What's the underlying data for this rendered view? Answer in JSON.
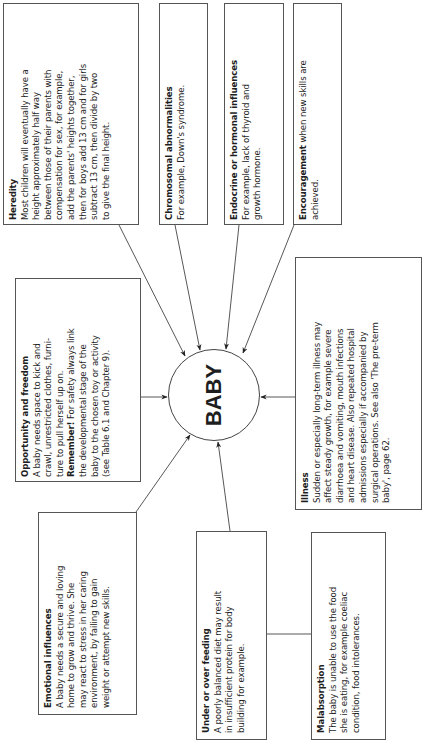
{
  "center": {
    "label": "BABY"
  },
  "boxes": {
    "heredity": {
      "title": "Heredity",
      "lines": [
        "Most children will eventually have a",
        "height approximately half way",
        "between those of their parents with",
        "compensation for sex, for example,",
        "add the parents' heights together,",
        "then for boys add 13 cm and for girls",
        "subtract 13 cm, then divide by two",
        "to give the final height."
      ]
    },
    "chromosomal": {
      "title": "Chromosomal abnormalities",
      "body": "For example, Down's syndrome."
    },
    "endocrine": {
      "title": "Endocrine or hormonal influences",
      "lines": [
        "For example, lack of thyroid and",
        "growth hormone."
      ]
    },
    "encouragement": {
      "title": "Encouragement",
      "body_inline": " when new skills are",
      "body_line2": "achieved."
    },
    "opportunity": {
      "title": "Opportunity and freedom",
      "lines": [
        "A baby needs space to kick and",
        "crawl, unrestricted clothes, furni-",
        "ture to pull herself up on."
      ],
      "remember_label": "Remember!",
      "remember_inline": " For safety always link",
      "remember_lines": [
        "the developmental stage of the",
        "baby to the chosen toy or activity",
        "(see Table 6.1 and Chapter 9)."
      ]
    },
    "illness": {
      "title": "Illness",
      "lines": [
        "Sudden or especially long-term illness may",
        "affect steady growth, for example severe",
        "diarrhoea and vomiting, mouth infections",
        "and heart disease. Also repeated hospital",
        "admissions especially if accompanied by",
        "surgical operations. See also 'The pre-term",
        "baby', page 62."
      ]
    },
    "emotional": {
      "title": "Emotional influences",
      "lines": [
        "A baby needs a secure and loving",
        "home to grow and thrive. She",
        "may react to stress in her caring",
        "environment, by failing to gain",
        "weight or attempt new skills."
      ]
    },
    "feeding": {
      "title": "Under or over feeding",
      "lines": [
        "A poorly balanced diet may result",
        "in insufficient  protein for body",
        "building for example."
      ]
    },
    "malabsorption": {
      "title": "Malabsorption",
      "lines": [
        "The baby is unable to use the food",
        "she is eating, for example coeliac",
        "condition, food intolerances."
      ]
    }
  },
  "colors": {
    "line": "#444444",
    "border": "#555555",
    "text": "#1e1e1e",
    "background": "#ffffff"
  }
}
